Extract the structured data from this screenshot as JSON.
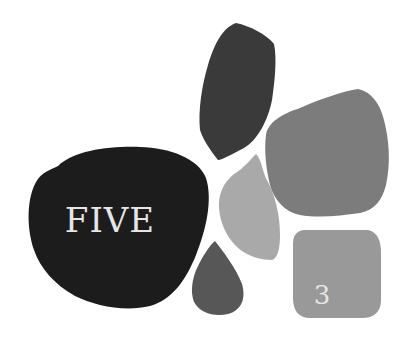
{
  "stones": [
    {
      "id": "big-black",
      "label": "FIVE",
      "color": "#1c1c1c"
    },
    {
      "id": "dark-top",
      "label": "",
      "color": "#3a3a3a"
    },
    {
      "id": "gray-large",
      "label": "",
      "color": "#7c7c7c"
    },
    {
      "id": "light-gray",
      "label": "",
      "color": "#a9a9a9"
    },
    {
      "id": "teardrop",
      "label": "",
      "color": "#575757"
    },
    {
      "id": "square-gray",
      "label": "3",
      "color": "#999999"
    }
  ]
}
